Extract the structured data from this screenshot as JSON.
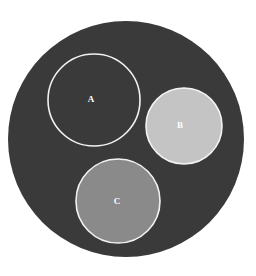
{
  "canvas": {
    "width": 256,
    "height": 276,
    "background_color": "#ffffff"
  },
  "chart_data": {
    "type": "diagram",
    "subtype": "nested-circles",
    "title": "",
    "background_color": "#ffffff",
    "outer_region": {
      "name": "outer-circle",
      "label": "",
      "cx": 126,
      "cy": 139,
      "r": 118,
      "fill": "#3a3a3a",
      "stroke": "none",
      "stroke_width": 0
    },
    "circles": [
      {
        "id": "A",
        "label": "A",
        "cx": 94,
        "cy": 100,
        "r": 46,
        "fill": "#3a3a3a",
        "stroke": "#f2f2f2",
        "stroke_width": 1.6,
        "label_color": "#ffffff",
        "label_x": 91,
        "label_y": 99
      },
      {
        "id": "B",
        "label": "B",
        "cx": 184,
        "cy": 126,
        "r": 38,
        "fill": "#c4c4c4",
        "stroke": "#f2f2f2",
        "stroke_width": 1.6,
        "label_color": "#ffffff",
        "label_x": 180,
        "label_y": 125
      },
      {
        "id": "C",
        "label": "C",
        "cx": 118,
        "cy": 201,
        "r": 42,
        "fill": "#8a8a8a",
        "stroke": "#f2f2f2",
        "stroke_width": 1.6,
        "label_color": "#ffffff",
        "label_x": 117,
        "label_y": 201
      }
    ],
    "legend": {
      "visible": false,
      "entries": []
    },
    "axes": {
      "visible": false
    },
    "grid": false
  }
}
